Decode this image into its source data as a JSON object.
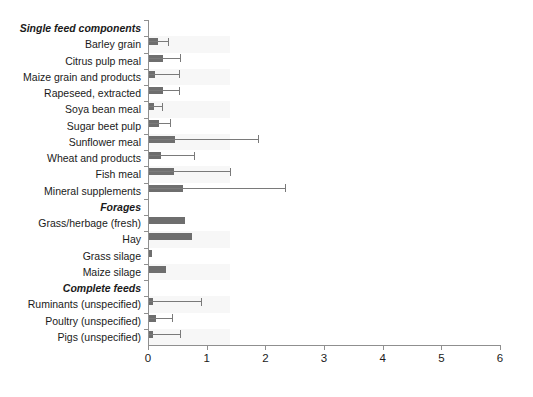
{
  "chart_data": {
    "type": "bar",
    "orientation": "horizontal",
    "title": "",
    "xlabel": "",
    "ylabel": "",
    "xlim": [
      0,
      6
    ],
    "xticks": [
      0,
      1,
      2,
      3,
      4,
      5,
      6
    ],
    "xticklabels": [
      "0",
      "1",
      "2",
      "3",
      "4",
      "5",
      "6"
    ],
    "grid": false,
    "legend": "none",
    "error_bars": "upper whisker with cap",
    "sections": [
      "Single feed components",
      "Forages",
      "Complete feeds"
    ],
    "categories": [
      "Single feed components",
      "Barley grain",
      "Citrus pulp meal",
      "Maize grain and products",
      "Rapeseed, extracted",
      "Soya bean meal",
      "Sugar beet pulp",
      "Sunflower meal",
      "Wheat and products",
      "Fish meal",
      "Mineral supplements",
      "Forages",
      "Grass/herbage (fresh)",
      "Hay",
      "Grass silage",
      "Maize silage",
      "Complete feeds",
      "Ruminants (unspecified)",
      "Poultry (unspecified)",
      "Pigs (unspecified)"
    ],
    "rows": [
      {
        "label": "Single feed components",
        "is_section": true,
        "value": null,
        "error_upper": null
      },
      {
        "label": "Barley grain",
        "is_section": false,
        "value": 0.17,
        "error_upper": 0.34
      },
      {
        "label": "Citrus pulp meal",
        "is_section": false,
        "value": 0.26,
        "error_upper": 0.55
      },
      {
        "label": "Maize grain and products",
        "is_section": false,
        "value": 0.12,
        "error_upper": 0.52
      },
      {
        "label": "Rapeseed, extracted",
        "is_section": false,
        "value": 0.25,
        "error_upper": 0.53
      },
      {
        "label": "Soya bean meal",
        "is_section": false,
        "value": 0.1,
        "error_upper": 0.24
      },
      {
        "label": "Sugar beet pulp",
        "is_section": false,
        "value": 0.19,
        "error_upper": 0.38
      },
      {
        "label": "Sunflower meal",
        "is_section": false,
        "value": 0.46,
        "error_upper": 1.87
      },
      {
        "label": "Wheat and products",
        "is_section": false,
        "value": 0.23,
        "error_upper": 0.78
      },
      {
        "label": "Fish meal",
        "is_section": false,
        "value": 0.44,
        "error_upper": 1.4
      },
      {
        "label": "Mineral supplements",
        "is_section": false,
        "value": 0.6,
        "error_upper": 2.33
      },
      {
        "label": "Forages",
        "is_section": true,
        "value": null,
        "error_upper": null
      },
      {
        "label": "Grass/herbage (fresh)",
        "is_section": false,
        "value": 0.63,
        "error_upper": null
      },
      {
        "label": "Hay",
        "is_section": false,
        "value": 0.75,
        "error_upper": null
      },
      {
        "label": "Grass silage",
        "is_section": false,
        "value": 0.06,
        "error_upper": null
      },
      {
        "label": "Maize silage",
        "is_section": false,
        "value": 0.31,
        "error_upper": null
      },
      {
        "label": "Complete feeds",
        "is_section": true,
        "value": null,
        "error_upper": null
      },
      {
        "label": "Ruminants (unspecified)",
        "is_section": false,
        "value": 0.08,
        "error_upper": 0.9
      },
      {
        "label": "Poultry (unspecified)",
        "is_section": false,
        "value": 0.13,
        "error_upper": 0.41
      },
      {
        "label": "Pigs (unspecified)",
        "is_section": false,
        "value": 0.08,
        "error_upper": 0.55
      }
    ],
    "colors": {
      "bar": "#6e6e6e",
      "error": "#7a7a7a",
      "axis": "#8f8f8f",
      "band": "#f7f7f7",
      "background": "#ffffff",
      "text": "#1a1a1a"
    }
  }
}
